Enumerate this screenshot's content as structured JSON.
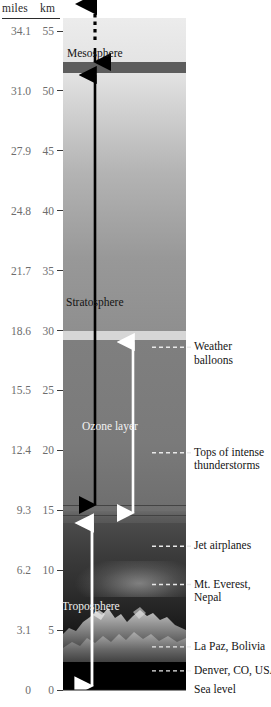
{
  "axis": {
    "header_miles": "miles",
    "header_km": "km",
    "ticks": [
      {
        "miles": "34.1",
        "km": "55"
      },
      {
        "miles": "31.0",
        "km": "50"
      },
      {
        "miles": "27.9",
        "km": "45"
      },
      {
        "miles": "24.8",
        "km": "40"
      },
      {
        "miles": "21.7",
        "km": "35"
      },
      {
        "miles": "18.6",
        "km": "30"
      },
      {
        "miles": "15.5",
        "km": "25"
      },
      {
        "miles": "12.4",
        "km": "20"
      },
      {
        "miles": "9.3",
        "km": "15"
      },
      {
        "miles": "6.2",
        "km": "10"
      },
      {
        "miles": "3.1",
        "km": "5"
      },
      {
        "miles": "0",
        "km": "0"
      }
    ]
  },
  "layers": {
    "mesosphere": "Mesosphere",
    "stratosphere": "Stratosphere",
    "ozone_layer": "Ozone layer",
    "troposphere": "Troposphere"
  },
  "callouts": [
    {
      "line1": "Weather",
      "line2": "balloons",
      "km": 28.6
    },
    {
      "line1": "Tops of intense",
      "line2": "thunderstorms",
      "km": 19.8
    },
    {
      "line1": "Jet airplanes",
      "line2": "",
      "km": 12.0
    },
    {
      "line1": "Mt. Everest,",
      "line2": "Nepal",
      "km": 8.8
    },
    {
      "line1": "La Paz, Bolivia",
      "line2": "",
      "km": 3.6
    },
    {
      "line1": "Denver, CO, USA",
      "line2": "",
      "km": 1.6
    },
    {
      "line1": "Sea level",
      "line2": "",
      "km": 0
    }
  ],
  "colors": {
    "stratopause_band": "#5d5d5d",
    "ozone_arrow": "#ffffff",
    "troposphere_arrow": "#ffffff",
    "stratosphere_arrow": "#000000",
    "tick_text": "#6d6d6d",
    "label_text": "#141414"
  },
  "chart_data": {
    "type": "diagram",
    "ylabel_primary": "km",
    "ylabel_secondary": "miles",
    "ylim_km": [
      0,
      55
    ],
    "ytick_km": [
      0,
      5,
      10,
      15,
      20,
      25,
      30,
      35,
      40,
      45,
      50,
      55
    ],
    "ytick_miles": [
      0,
      3.1,
      6.2,
      9.3,
      12.4,
      15.5,
      18.6,
      21.7,
      24.8,
      27.9,
      31.0,
      34.1
    ],
    "grid": false,
    "legend": "none",
    "bands": [
      {
        "name": "Mesosphere",
        "from_km": 50,
        "to_km": 55
      },
      {
        "name": "Stratopause",
        "from_km": 49,
        "to_km": 50
      },
      {
        "name": "Stratosphere",
        "from_km": 15,
        "to_km": 49
      },
      {
        "name": "Ozone layer",
        "from_km": 15,
        "to_km": 30
      },
      {
        "name": "Tropopause",
        "from_km": 14,
        "to_km": 15
      },
      {
        "name": "Troposphere",
        "from_km": 0,
        "to_km": 14
      }
    ],
    "markers": [
      {
        "label": "Weather balloons",
        "km": 28.6
      },
      {
        "label": "Tops of intense thunderstorms",
        "km": 19.8
      },
      {
        "label": "Jet airplanes",
        "km": 12.0
      },
      {
        "label": "Mt. Everest, Nepal",
        "km": 8.8
      },
      {
        "label": "La Paz, Bolivia",
        "km": 3.6
      },
      {
        "label": "Denver, CO, USA",
        "km": 1.6
      },
      {
        "label": "Sea level",
        "km": 0
      }
    ],
    "span_arrows": [
      {
        "label": "Mesosphere",
        "from_km": 50,
        "to_km": 56,
        "color": "#000000"
      },
      {
        "label": "Stratosphere",
        "from_km": 15,
        "to_km": 50,
        "color": "#000000"
      },
      {
        "label": "Ozone layer",
        "from_km": 15,
        "to_km": 30,
        "color": "#ffffff"
      },
      {
        "label": "Troposphere",
        "from_km": 0,
        "to_km": 14,
        "color": "#ffffff"
      }
    ]
  }
}
